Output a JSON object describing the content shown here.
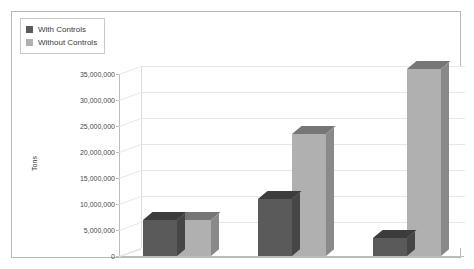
{
  "legend": {
    "position": "top-left",
    "items": [
      {
        "label": "With Controls",
        "color": "#5a5a5a",
        "key": "with-controls"
      },
      {
        "label": "Without Controls",
        "color": "#b0b0b0",
        "key": "without-controls"
      }
    ]
  },
  "axes": {
    "ylabel": "Tons",
    "yticks": [
      "0",
      "5,000,000",
      "10,000,000",
      "15,000,000",
      "20,000,000",
      "25,000,000",
      "30,000,000",
      "35,000,000"
    ],
    "xticks": [
      "1970",
      "2000",
      "2020 (projected)"
    ]
  },
  "chart_data": {
    "type": "bar",
    "title": "",
    "subtitle": "",
    "xlabel": "",
    "ylabel": "Tons",
    "categories": [
      "1970",
      "2000",
      "2020 (projected)"
    ],
    "series": [
      {
        "name": "With Controls",
        "color": "#5a5a5a",
        "values": [
          7000000,
          11000000,
          3500000
        ]
      },
      {
        "name": "Without Controls",
        "color": "#b0b0b0",
        "values": [
          7000000,
          23500000,
          36000000
        ]
      }
    ],
    "ylim": [
      0,
      35000000
    ],
    "ytick_step": 5000000,
    "grid": true,
    "legend_position": "top-left",
    "three_d": true
  }
}
